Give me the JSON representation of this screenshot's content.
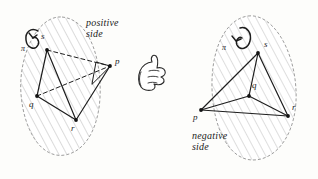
{
  "figure": {
    "caption_positive": "positive\nside",
    "caption_negative": "negative\nside",
    "ink_color": "#1d1d1d",
    "hatch_color": "#b9b9b9",
    "outline_color": "#9a9a9a",
    "background": "#fdfdfb"
  },
  "left_figure": {
    "name": "positive-side-tetrahedron",
    "plane_label": "π",
    "orientation_arrow": "counterclockwise-loop-arrow",
    "side_caption": "positive\nside",
    "vertices": [
      {
        "id": "s",
        "label": "s",
        "x": 47,
        "y": 50,
        "label_x": 41,
        "label_y": 36
      },
      {
        "id": "q",
        "label": "q",
        "x": 37,
        "y": 96,
        "label_x": 30,
        "label_y": 100
      },
      {
        "id": "r",
        "label": "r",
        "x": 76,
        "y": 120,
        "label_x": 72,
        "label_y": 124
      },
      {
        "id": "p",
        "label": "p",
        "x": 110,
        "y": 66,
        "label_x": 115,
        "label_y": 55
      }
    ],
    "edges": [
      {
        "from": "s",
        "to": "q",
        "style": "solid"
      },
      {
        "from": "s",
        "to": "r",
        "style": "solid"
      },
      {
        "from": "s",
        "to": "p",
        "style": "dashed"
      },
      {
        "from": "q",
        "to": "r",
        "style": "solid"
      },
      {
        "from": "q",
        "to": "p",
        "style": "dashed"
      },
      {
        "from": "r",
        "to": "p",
        "style": "solid"
      }
    ]
  },
  "right_figure": {
    "name": "negative-side-tetrahedron",
    "plane_label": "π",
    "orientation_arrow": "counterclockwise-loop-arrow",
    "side_caption": "negative\nside",
    "vertices": [
      {
        "id": "s",
        "label": "s",
        "x": 258,
        "y": 53,
        "label_x": 264,
        "label_y": 43
      },
      {
        "id": "q",
        "label": "q",
        "x": 249,
        "y": 96,
        "label_x": 252,
        "label_y": 84
      },
      {
        "id": "r",
        "label": "r",
        "x": 288,
        "y": 116,
        "label_x": 292,
        "label_y": 105
      },
      {
        "id": "p",
        "label": "p",
        "x": 201,
        "y": 110,
        "label_x": 196,
        "label_y": 113
      }
    ],
    "edges": [
      {
        "from": "s",
        "to": "p",
        "style": "solid"
      },
      {
        "from": "s",
        "to": "q",
        "style": "solid"
      },
      {
        "from": "s",
        "to": "r",
        "style": "solid"
      },
      {
        "from": "q",
        "to": "p",
        "style": "solid"
      },
      {
        "from": "q",
        "to": "r",
        "style": "solid"
      },
      {
        "from": "p",
        "to": "r",
        "style": "solid"
      }
    ]
  },
  "hand": {
    "name": "thumbs-up-hand-icon",
    "x": 148,
    "y": 62
  }
}
